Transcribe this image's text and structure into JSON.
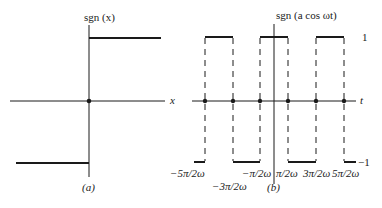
{
  "panel_a": {
    "title": "sgn (x)",
    "x_label": "x",
    "caption": "(a)",
    "levels": {
      "high": 1,
      "low": -1
    },
    "step_at": 0
  },
  "panel_b": {
    "title": "sgn (a cos ωt)",
    "x_label": "t",
    "caption": "(b)",
    "level_labels": {
      "high": "1",
      "low": "−1"
    },
    "tick_labels": [
      "−5π/2ω",
      "−3π/2ω",
      "−π/2ω",
      "π/2ω",
      "3π/2ω",
      "5π/2ω"
    ],
    "pulses_high": [
      {
        "from": "−5π/2ω",
        "to": "−3π/2ω"
      },
      {
        "from": "−π/2ω",
        "to": "π/2ω"
      },
      {
        "from": "3π/2ω",
        "to": "5π/2ω"
      }
    ]
  },
  "colors": {
    "ink": "#1a1a1a",
    "background": "#ffffff"
  }
}
